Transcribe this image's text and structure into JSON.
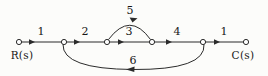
{
  "figure": {
    "kind": "signal-flow-graph",
    "background_color": "#fcfcfa",
    "stroke_color": "#2b2b2b",
    "text_color": "#171717",
    "node_fill": "#ffffff",
    "baseline_y": 42
  },
  "nodes": [
    {
      "id": "n1",
      "label": "R(s)",
      "x": 19,
      "y": 42,
      "r": 2.6,
      "label_x": 22,
      "label_y": 50
    },
    {
      "id": "n2",
      "label": "",
      "x": 64,
      "y": 42,
      "r": 2.6
    },
    {
      "id": "n3",
      "label": "",
      "x": 107,
      "y": 42,
      "r": 2.6
    },
    {
      "id": "n4",
      "label": "",
      "x": 152,
      "y": 42,
      "r": 2.6
    },
    {
      "id": "n5",
      "label": "",
      "x": 203,
      "y": 42,
      "r": 2.6
    },
    {
      "id": "n6",
      "label": "C(s)",
      "x": 246,
      "y": 42,
      "r": 2.6,
      "label_x": 243,
      "label_y": 50
    }
  ],
  "branches": [
    {
      "id": "b1",
      "from": "n1",
      "to": "n2",
      "gain": "1",
      "shape": "straight",
      "direction": "right",
      "label_x": 41,
      "label_y": 26
    },
    {
      "id": "b2",
      "from": "n2",
      "to": "n3",
      "gain": "2",
      "shape": "straight",
      "direction": "right",
      "label_x": 85,
      "label_y": 26
    },
    {
      "id": "b3",
      "from": "n3",
      "to": "n4",
      "gain": "3",
      "shape": "straight",
      "direction": "right",
      "label_x": 129,
      "label_y": 26
    },
    {
      "id": "b4",
      "from": "n4",
      "to": "n5",
      "gain": "4",
      "shape": "straight",
      "direction": "right",
      "label_x": 177,
      "label_y": 26
    },
    {
      "id": "b5",
      "from": "n5",
      "to": "n6",
      "gain": "1",
      "shape": "straight",
      "direction": "right",
      "label_x": 224,
      "label_y": 26
    },
    {
      "id": "b6",
      "from": "n3",
      "to": "n4",
      "gain": "5",
      "shape": "arc-above",
      "direction": "right",
      "label_x": 130,
      "label_y": 5
    },
    {
      "id": "b7",
      "from": "n5",
      "to": "n2",
      "gain": "6",
      "shape": "arc-below",
      "direction": "left",
      "label_x": 133,
      "label_y": 55
    }
  ],
  "io_labels": {
    "input": "R(s)",
    "output": "C(s)"
  },
  "gain_labels": [
    "1",
    "2",
    "3",
    "4",
    "1",
    "5",
    "6"
  ]
}
